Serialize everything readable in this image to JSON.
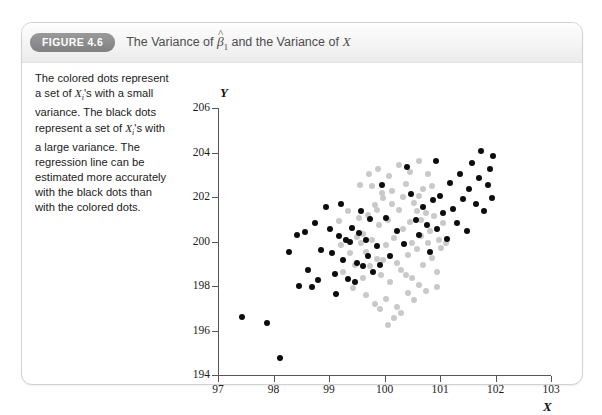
{
  "figure": {
    "badge_label": "FIGURE 4.6",
    "title_prefix": "The Variance of ",
    "title_beta": "β",
    "title_beta_sub": "1",
    "title_middle": " and the Variance of ",
    "title_x": "X",
    "caption_line_1": "The colored dots represent",
    "caption_line_2a": "a set of ",
    "caption_line_2b": "X",
    "caption_line_2c": "i",
    "caption_line_2d": "'s with a small",
    "caption_line_3": "variance. The black dots",
    "caption_line_4a": "represent a set of ",
    "caption_line_4b": "X",
    "caption_line_4c": "i",
    "caption_line_4d": "'s with",
    "caption_line_5": "a large variance. The",
    "caption_line_6": "regression line can be",
    "caption_line_7": "estimated more accurately",
    "caption_line_8": "with the black dots than",
    "caption_line_9": "with the colored dots."
  },
  "colors": {
    "black_series": "#0d0d0d",
    "gray_series": "#c9c9c9",
    "axis": "#555555",
    "badge_bg": "#8e8e8e",
    "card_border": "#d2d2d2"
  },
  "chart_data": {
    "type": "scatter",
    "xlabel": "X",
    "ylabel": "Y",
    "xlim": [
      97,
      103
    ],
    "ylim": [
      194,
      206
    ],
    "xticks": [
      97,
      98,
      99,
      100,
      101,
      102,
      103
    ],
    "yticks": [
      194,
      196,
      198,
      200,
      202,
      204,
      206
    ],
    "grid": false,
    "legend": null,
    "series": [
      {
        "name": "black dots (large variance of X)",
        "color": "#0d0d0d",
        "marker_size_px": 6,
        "points": [
          [
            97.44,
            196.62
          ],
          [
            97.88,
            196.35
          ],
          [
            98.12,
            194.75
          ],
          [
            98.28,
            199.55
          ],
          [
            98.42,
            200.28
          ],
          [
            98.56,
            200.42
          ],
          [
            98.46,
            198.0
          ],
          [
            98.62,
            198.72
          ],
          [
            98.74,
            200.85
          ],
          [
            98.86,
            199.62
          ],
          [
            98.8,
            198.28
          ],
          [
            98.95,
            201.55
          ],
          [
            99.02,
            200.55
          ],
          [
            99.06,
            199.48
          ],
          [
            99.1,
            198.52
          ],
          [
            99.18,
            200.25
          ],
          [
            99.22,
            201.7
          ],
          [
            99.26,
            199.15
          ],
          [
            99.3,
            200.05
          ],
          [
            99.34,
            198.3
          ],
          [
            99.38,
            199.98
          ],
          [
            99.42,
            200.62
          ],
          [
            99.46,
            198.18
          ],
          [
            99.5,
            199.05
          ],
          [
            99.54,
            200.38
          ],
          [
            99.58,
            201.35
          ],
          [
            99.62,
            198.92
          ],
          [
            99.66,
            200.05
          ],
          [
            99.7,
            199.35
          ],
          [
            99.74,
            201.02
          ],
          [
            99.8,
            198.65
          ],
          [
            99.86,
            199.82
          ],
          [
            99.92,
            198.95
          ],
          [
            100.02,
            201.05
          ],
          [
            100.1,
            199.35
          ],
          [
            100.22,
            200.48
          ],
          [
            100.35,
            199.88
          ],
          [
            100.48,
            202.15
          ],
          [
            100.56,
            200.98
          ],
          [
            100.62,
            200.3
          ],
          [
            100.7,
            201.55
          ],
          [
            100.76,
            200.72
          ],
          [
            100.82,
            199.55
          ],
          [
            100.88,
            201.88
          ],
          [
            100.94,
            200.58
          ],
          [
            101.0,
            202.05
          ],
          [
            101.06,
            201.28
          ],
          [
            101.12,
            200.1
          ],
          [
            101.18,
            202.62
          ],
          [
            101.24,
            201.45
          ],
          [
            101.3,
            200.82
          ],
          [
            101.36,
            203.05
          ],
          [
            101.42,
            201.92
          ],
          [
            101.48,
            200.45
          ],
          [
            101.52,
            202.38
          ],
          [
            101.58,
            203.55
          ],
          [
            101.64,
            201.68
          ],
          [
            101.7,
            202.85
          ],
          [
            101.74,
            204.05
          ],
          [
            101.8,
            201.38
          ],
          [
            101.86,
            202.52
          ],
          [
            101.9,
            203.28
          ],
          [
            101.94,
            201.95
          ],
          [
            101.96,
            203.85
          ],
          [
            100.4,
            203.35
          ],
          [
            100.92,
            203.62
          ],
          [
            99.95,
            202.55
          ],
          [
            98.7,
            197.95
          ],
          [
            99.12,
            197.62
          ]
        ]
      },
      {
        "name": "colored/gray dots (small variance of X)",
        "color": "#c9c9c9",
        "marker_size_px": 6,
        "points": [
          [
            99.62,
            200.35
          ],
          [
            99.66,
            199.52
          ],
          [
            99.7,
            201.18
          ],
          [
            99.74,
            198.88
          ],
          [
            99.78,
            200.05
          ],
          [
            99.82,
            201.62
          ],
          [
            99.86,
            199.22
          ],
          [
            99.9,
            200.72
          ],
          [
            99.94,
            198.48
          ],
          [
            99.98,
            201.95
          ],
          [
            100.02,
            199.85
          ],
          [
            100.06,
            200.95
          ],
          [
            100.1,
            198.18
          ],
          [
            100.14,
            202.25
          ],
          [
            100.18,
            200.15
          ],
          [
            100.22,
            199.05
          ],
          [
            100.26,
            201.42
          ],
          [
            100.3,
            198.72
          ],
          [
            100.34,
            200.58
          ],
          [
            100.38,
            202.58
          ],
          [
            100.42,
            199.38
          ],
          [
            100.46,
            200.88
          ],
          [
            100.5,
            198.35
          ],
          [
            100.54,
            201.75
          ],
          [
            100.58,
            199.68
          ],
          [
            100.62,
            202.05
          ],
          [
            100.66,
            200.25
          ],
          [
            100.7,
            198.95
          ],
          [
            100.74,
            201.28
          ],
          [
            100.78,
            199.95
          ],
          [
            99.58,
            199.95
          ],
          [
            99.54,
            201.05
          ],
          [
            99.5,
            200.18
          ],
          [
            99.46,
            198.95
          ],
          [
            99.42,
            200.62
          ],
          [
            99.38,
            199.48
          ],
          [
            99.34,
            201.35
          ],
          [
            99.3,
            200.05
          ],
          [
            99.26,
            198.65
          ],
          [
            100.82,
            200.45
          ],
          [
            100.86,
            199.28
          ],
          [
            100.9,
            201.15
          ],
          [
            100.94,
            198.62
          ],
          [
            100.98,
            200.05
          ],
          [
            101.02,
            199.72
          ],
          [
            99.72,
            203.02
          ],
          [
            99.88,
            203.28
          ],
          [
            100.08,
            202.95
          ],
          [
            100.26,
            203.45
          ],
          [
            100.46,
            203.12
          ],
          [
            100.62,
            203.62
          ],
          [
            99.66,
            197.58
          ],
          [
            99.82,
            197.18
          ],
          [
            100.02,
            197.42
          ],
          [
            100.22,
            197.05
          ],
          [
            100.42,
            197.68
          ],
          [
            100.06,
            196.25
          ],
          [
            99.92,
            196.95
          ],
          [
            100.3,
            196.78
          ],
          [
            100.54,
            197.35
          ],
          [
            99.78,
            202.48
          ],
          [
            100.14,
            201.68
          ],
          [
            100.34,
            202.02
          ],
          [
            100.58,
            201.35
          ],
          [
            100.7,
            202.35
          ],
          [
            99.96,
            202.18
          ],
          [
            99.56,
            202.52
          ],
          [
            100.86,
            202.48
          ],
          [
            100.78,
            203.05
          ],
          [
            99.44,
            197.92
          ],
          [
            99.62,
            198.35
          ],
          [
            100.62,
            198.05
          ],
          [
            100.74,
            197.78
          ],
          [
            100.94,
            197.95
          ],
          [
            101.06,
            200.85
          ],
          [
            101.1,
            199.95
          ],
          [
            99.22,
            199.85
          ],
          [
            99.18,
            200.92
          ],
          [
            100.18,
            196.55
          ],
          [
            100.38,
            198.48
          ],
          [
            99.98,
            199.15
          ],
          [
            100.5,
            199.95
          ],
          [
            100.66,
            200.98
          ],
          [
            99.86,
            201.42
          ]
        ]
      }
    ]
  }
}
